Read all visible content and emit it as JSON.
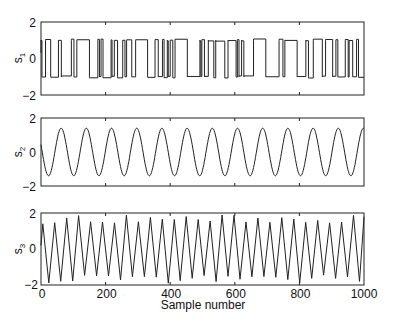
{
  "chart_data": [
    {
      "type": "line",
      "id": "s1",
      "ylabel": "s",
      "ylabel_sub": "1",
      "ylim": [
        -2,
        2
      ],
      "yticks": [
        -2,
        0,
        2
      ],
      "xlim": [
        0,
        1000
      ],
      "xticks": [
        0,
        200,
        400,
        600,
        800,
        1000
      ],
      "show_xticklabels": false,
      "description": "Random binary (square-wave) signal switching between approximately +1 and -1",
      "levels": [
        1,
        -1
      ]
    },
    {
      "type": "line",
      "id": "s2",
      "ylabel": "s",
      "ylabel_sub": "2",
      "ylim": [
        -2,
        2
      ],
      "yticks": [
        -2,
        0,
        2
      ],
      "xlim": [
        0,
        1000
      ],
      "xticks": [
        0,
        200,
        400,
        600,
        800,
        1000
      ],
      "show_xticklabels": false,
      "description": "Sinusoid, amplitude ~1.4, ~13 cycles over 1000 samples",
      "amplitude": 1.4,
      "period_samples": 78
    },
    {
      "type": "line",
      "id": "s3",
      "ylabel": "s",
      "ylabel_sub": "3",
      "ylim": [
        -2,
        2
      ],
      "yticks": [
        -2,
        0,
        2
      ],
      "xlim": [
        0,
        1000
      ],
      "xticks": [
        0,
        200,
        400,
        600,
        800,
        1000
      ],
      "xticklabels": [
        "0",
        "200",
        "400",
        "600",
        "800",
        "1000"
      ],
      "show_xticklabels": true,
      "xlabel": "Sample number",
      "description": "Triangle/sawtooth-like wave, amplitude ~1.5-1.9, ~27 cycles over 1000 samples",
      "amplitude": 1.7,
      "period_samples": 37
    }
  ],
  "labels": {
    "ytick_top": "2",
    "ytick_mid": "0",
    "ytick_bot": "−2",
    "xlabel": "Sample number",
    "s": "s",
    "sub1": "1",
    "sub2": "2",
    "sub3": "3",
    "x0": "0",
    "x200": "200",
    "x400": "400",
    "x600": "600",
    "x800": "800",
    "x1000": "1000"
  }
}
